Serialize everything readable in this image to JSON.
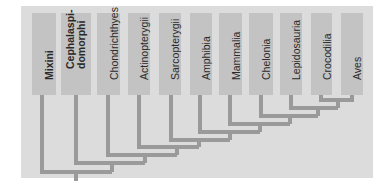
{
  "diagram": {
    "type": "cladogram",
    "colors": {
      "panel": "#dcdcdc",
      "box": "#c3c3c3",
      "line": "#9a9a9a",
      "text": "#2a2a2a"
    },
    "taxa": [
      {
        "name": "Mixini",
        "bold": true
      },
      {
        "name": "Cephalaspi-\ndomorphi",
        "bold": true
      },
      {
        "name": "Chondrichthyes",
        "bold": false
      },
      {
        "name": "Actinopterygii",
        "bold": false
      },
      {
        "name": "Sarcopterygii",
        "bold": false
      },
      {
        "name": "Amphibia",
        "bold": false
      },
      {
        "name": "Mammalia",
        "bold": false
      },
      {
        "name": "Chelonia",
        "bold": false
      },
      {
        "name": "Lepidosauria",
        "bold": false
      },
      {
        "name": "Crocodilia",
        "bold": false
      },
      {
        "name": "Aves",
        "bold": false
      }
    ],
    "topology": "(Mixini,(Cephalaspidomorphi,(Chondrichthyes,(Actinopterygii,(Sarcopterygii,(Amphibia,(Mammalia,(Chelonia,(Lepidosauria,(Crocodilia,Aves))))))))))"
  }
}
